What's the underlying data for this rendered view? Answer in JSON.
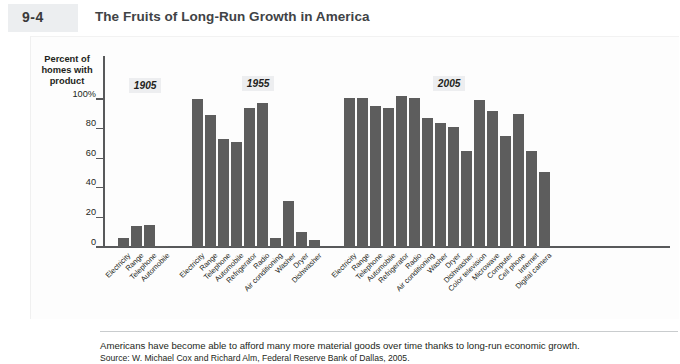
{
  "figure": {
    "kicker": "FIGURE",
    "number": "9-4",
    "title": "The Fruits of Long-Run Growth in America"
  },
  "axis": {
    "y_title": "Percent of homes with product",
    "y_ticks": [
      "100%",
      "80",
      "60",
      "40",
      "20",
      "0"
    ]
  },
  "groups": [
    {
      "label": "1905"
    },
    {
      "label": "1955"
    },
    {
      "label": "2005"
    }
  ],
  "caption": {
    "line1": "Americans have become able to afford many more material goods over time thanks to long-run economic growth.",
    "line2": "Source: W. Michael Cox and Richard Alm, Federal Reserve Bank of Dallas, 2005."
  },
  "chart_data": {
    "type": "bar",
    "title": "The Fruits of Long-Run Growth in America",
    "xlabel": "",
    "ylabel": "Percent of homes with product",
    "ylim": [
      0,
      100
    ],
    "yticks": [
      0,
      20,
      40,
      60,
      80,
      100
    ],
    "grid": false,
    "legend": "none",
    "bar_color": "#5d5d5d",
    "groups": [
      {
        "name": "1905",
        "categories": [
          "Electricity",
          "Range",
          "Telephone",
          "Automobile"
        ],
        "values": [
          6,
          14,
          15,
          1
        ]
      },
      {
        "name": "1955",
        "categories": [
          "Electricity",
          "Range",
          "Telephone",
          "Automobile",
          "Refrigerator",
          "Radio",
          "Air conditioning",
          "Washer",
          "Dryer",
          "Dishwasher"
        ],
        "values": [
          100,
          89,
          73,
          71,
          94,
          97,
          6,
          31,
          10,
          5
        ]
      },
      {
        "name": "2005",
        "categories": [
          "Electricity",
          "Range",
          "Telephone",
          "Automobile",
          "Refrigerator",
          "Radio",
          "Air conditioning",
          "Washer",
          "Dryer",
          "Dishwasher",
          "Color television",
          "Microwave",
          "Computer",
          "Cell phone",
          "Internet",
          "Digital camera"
        ],
        "values": [
          101,
          101,
          95,
          94,
          102,
          101,
          87,
          84,
          81,
          65,
          99,
          92,
          75,
          90,
          65,
          51
        ]
      }
    ]
  }
}
